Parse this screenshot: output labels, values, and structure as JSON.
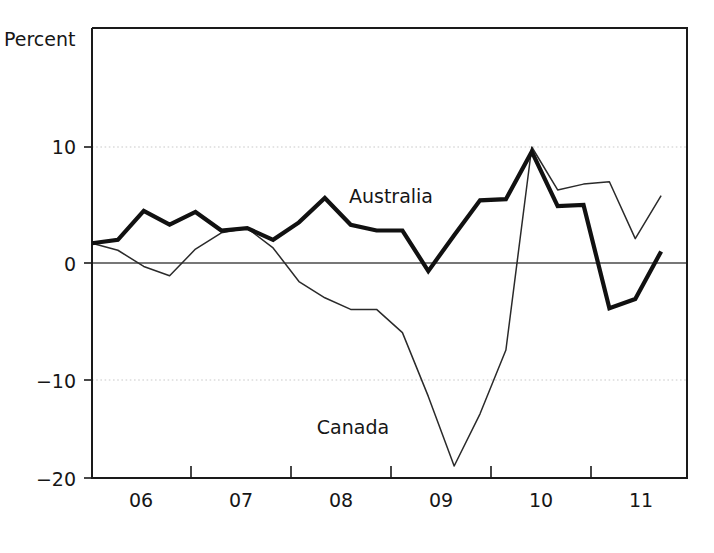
{
  "chart_data": {
    "type": "line",
    "title": "",
    "subtitle": "",
    "xlabel": "",
    "ylabel": "Percent",
    "ylim": [
      -20,
      14
    ],
    "xlim": [
      2005.75,
      2011.5
    ],
    "yticks": [
      10,
      0,
      -10,
      -20
    ],
    "ytick_labels": [
      "10",
      "0",
      "−10",
      "−20"
    ],
    "xticks": [
      2006,
      2007,
      2008,
      2009,
      2010,
      2011
    ],
    "xtick_labels": [
      "06",
      "07",
      "08",
      "09",
      "10",
      "11"
    ],
    "grid": "horizontal-dotted-at-10-and-minus-10",
    "zero_line": true,
    "legend_position": "inline-annotations",
    "annotations": [
      {
        "text": "Australia",
        "x": 2009.1,
        "y": 7.2
      },
      {
        "text": "Canada",
        "x": 2008.55,
        "y": -13.5
      }
    ],
    "x": [
      2005.75,
      2006.0,
      2006.25,
      2006.5,
      2006.75,
      2007.0,
      2007.25,
      2007.5,
      2007.75,
      2008.0,
      2008.25,
      2008.5,
      2008.75,
      2009.0,
      2009.25,
      2009.5,
      2009.75,
      2010.0,
      2010.25,
      2010.5,
      2010.75,
      2011.0,
      2011.25
    ],
    "series": [
      {
        "name": "Australia",
        "style": "thick-black",
        "color": "#111111",
        "linewidth": 4.2,
        "values": [
          1.7,
          2.0,
          4.5,
          3.3,
          4.4,
          2.8,
          3.0,
          2.0,
          3.5,
          5.6,
          3.3,
          2.8,
          2.8,
          -0.7,
          2.4,
          5.4,
          5.5,
          9.6,
          4.9,
          5.0,
          -3.9,
          -3.1,
          1.0
        ]
      },
      {
        "name": "Canada",
        "style": "thin-black",
        "color": "#2a2a2a",
        "linewidth": 1.5,
        "values": [
          1.7,
          1.1,
          -0.3,
          -1.1,
          1.2,
          2.6,
          3.0,
          1.3,
          -1.6,
          -3.0,
          -4.0,
          -4.0,
          -6.0,
          -11.5,
          -17.5,
          -13.0,
          -7.5,
          10.0,
          6.3,
          6.8,
          7.0,
          2.1,
          5.8
        ]
      }
    ]
  },
  "axes": {
    "unit_label": "Percent",
    "y_tick_labels": [
      "10",
      "0",
      "−10",
      "−20"
    ],
    "x_tick_labels": [
      "06",
      "07",
      "08",
      "09",
      "10",
      "11"
    ]
  },
  "labels": {
    "australia": "Australia",
    "canada": "Canada"
  },
  "colors": {
    "australia_line": "#111111",
    "canada_line": "#2a2a2a",
    "frame": "#1a1a1a",
    "grid": "#c9c9c9",
    "zero_line": "#4a4a4a",
    "background": "#ffffff",
    "text": "#161616"
  }
}
